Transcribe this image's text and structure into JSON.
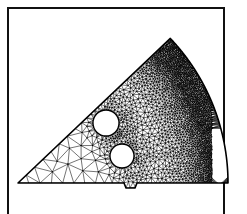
{
  "figure": {
    "title": "",
    "caption": "",
    "background_color": "#ffffff",
    "ink_color": "#000000"
  },
  "frame": {
    "name": "figure-border",
    "x": 7,
    "y": 7,
    "width": 218,
    "height": 214,
    "stroke_width": 2,
    "stroke_color": "#111111",
    "fill": "#ffffff"
  },
  "chart_data": {
    "type": "diagram",
    "subtype": "finite-element-triangular-mesh",
    "title": "",
    "xlabel": "",
    "ylabel": "",
    "grid": false,
    "legend": null,
    "domain_description": "Sector of a slotted rotor / gear disc meshed with graded unstructured triangles",
    "mesh": {
      "element_type": "triangle",
      "edge_color": "#000000",
      "face_color": "#ffffff",
      "edge_width": 0.55,
      "refinement": "graded: coarse at left apex, very fine along outer arc and slot scallops",
      "approx_element_count": 2400,
      "approx_node_count": 1300,
      "seed": 20250412
    },
    "outline": {
      "apex_top": [
        163,
        41
      ],
      "apex_left": [
        18,
        183
      ],
      "bottom_edge_y": 183,
      "bottom_notch": {
        "x_start": 124,
        "x_end": 137,
        "depth": 5
      },
      "arc": {
        "center": [
          18,
          183
        ],
        "radius": 210,
        "start_angle_deg": -43.5,
        "end_angle_deg": 0.0
      },
      "bottom_right": [
        205,
        183
      ]
    },
    "holes": [
      {
        "name": "upper-bolt-hole",
        "center": [
          106,
          123
        ],
        "radius": 13
      },
      {
        "name": "lower-bolt-hole",
        "center": [
          122,
          156
        ],
        "radius": 12
      }
    ],
    "refinement_band": {
      "name": "scalloped-slot-boundary",
      "description": "Wavy interior boundary separating the coarse interior mesh from the dense outer rim mesh",
      "scallop_count": 6,
      "amplitude": 11,
      "inner_radius": 118,
      "outer_radius": 210
    },
    "density_zones": [
      {
        "name": "coarse-zone",
        "location": "lower-left apex",
        "relative_element_size": 1.0
      },
      {
        "name": "medium-zone",
        "location": "central body",
        "relative_element_size": 0.55
      },
      {
        "name": "fine-zone",
        "location": "around holes",
        "relative_element_size": 0.3
      },
      {
        "name": "very-fine-zone",
        "location": "outer arc rim",
        "relative_element_size": 0.13
      }
    ]
  }
}
